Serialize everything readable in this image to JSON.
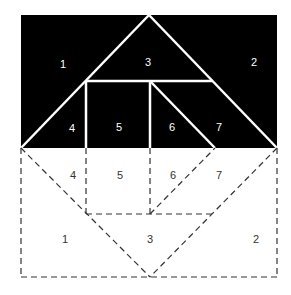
{
  "diagram": {
    "colors": {
      "fill": "#000000",
      "cut_line": "#ffffff",
      "dashed_line": "#333333",
      "background": "#ffffff"
    },
    "top_labels": {
      "p1": "1",
      "p2": "2",
      "p3": "3",
      "p4": "4",
      "p5": "5",
      "p6": "6",
      "p7": "7"
    },
    "bottom_labels": {
      "p1": "1",
      "p2": "2",
      "p3": "3",
      "p4": "4",
      "p5": "5",
      "p6": "6",
      "p7": "7"
    }
  }
}
